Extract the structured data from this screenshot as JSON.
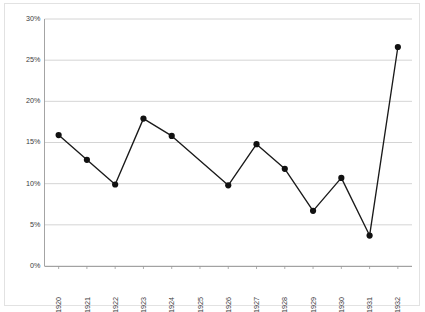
{
  "chart_data": {
    "type": "line",
    "title": "",
    "xlabel": "",
    "ylabel": "",
    "categories": [
      "1920",
      "1921",
      "1922",
      "1923",
      "1924",
      "1925",
      "1926",
      "1927",
      "1928",
      "1929",
      "1930",
      "1931",
      "1932"
    ],
    "values": [
      15.9,
      12.9,
      9.9,
      17.9,
      15.8,
      null,
      9.8,
      14.8,
      11.8,
      6.7,
      10.7,
      3.7,
      26.6
    ],
    "series": [
      {
        "name": "series-1",
        "values": [
          15.9,
          12.9,
          9.9,
          17.9,
          15.8,
          null,
          9.8,
          14.8,
          11.8,
          6.7,
          10.7,
          3.7,
          26.6
        ]
      }
    ],
    "ylim": [
      0,
      30
    ],
    "ytick_values": [
      0,
      5,
      10,
      15,
      20,
      25,
      30
    ],
    "ytick_labels": [
      "0%",
      "5%",
      "10%",
      "15%",
      "20%",
      "25%",
      "30%"
    ],
    "xtick_labels": [
      "1920",
      "1921",
      "1922",
      "1923",
      "1924",
      "1925",
      "1926",
      "1927",
      "1928",
      "1929",
      "1930",
      "1931",
      "1932"
    ],
    "grid": true,
    "grid_axis": "y",
    "legend": false,
    "legend_position": "none",
    "marker": "circle",
    "line_color": "#111111",
    "marker_color": "#111111",
    "gridline_color": "#c9c9c9",
    "axis_color": "#9a9a9a",
    "background_color": "#ffffff",
    "xtick_rotation": 90
  }
}
